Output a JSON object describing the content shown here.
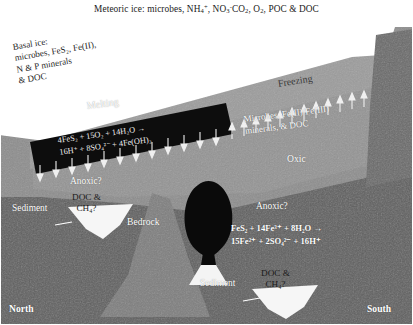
{
  "figure": {
    "title_caption": "Meteoric ice: microbes, NH4+, NO3-CO2, O2, POC & DOC",
    "caption_parts": {
      "lead": "Meteoric ice: microbes, NH",
      "nh4_sub": "4",
      "nh4_sup": "+",
      "mid": ", NO",
      "no3_sub": "3",
      "no3_sup": "-",
      "co2": "CO",
      "co2_sub": "2",
      "comma": ", O",
      "o2_sub": "2",
      "tail": ", POC & DOC"
    }
  },
  "labels": {
    "basal_ice": {
      "line1": "Basal ice:",
      "line2": "microbes, FeS₂, Fe(II),",
      "line3": "N & P minerals",
      "line4": "& DOC"
    },
    "melting": "Melting",
    "freezing": "Freezing",
    "oxic": "Oxic",
    "anoxic_left": "Anoxic?",
    "anoxic_right": "Anoxic?",
    "bedrock": "Bedrock",
    "sediment_left": "Sediment",
    "sediment_bottom": "Sediment",
    "north": "North",
    "south": "South",
    "right_solutes": {
      "line1": "Microbes, Fe(II)/Fe(III)",
      "line2": "minerals, & DOC"
    },
    "pocket_left": {
      "line1": "DOC &",
      "line2": "CH₄?"
    },
    "pocket_bottom": {
      "line1": "DOC &",
      "line2": "CH₄?"
    }
  },
  "equations": {
    "pyrite_oxidation": {
      "line1": "4FeS₂ + 15O₂ + 14H₂O →",
      "line2": "16H⁺ + 8SO₄²⁻ + 4Fe(OH)₃"
    },
    "ferric_pyrite_oxidation": {
      "line1": "FeS₂ + 14Fe³⁺ + 8H₂O →",
      "line2": "15Fe²⁺ + 2SO₄²⁻ + 16H⁺"
    }
  },
  "colors": {
    "background": "#ffffff",
    "meteoric_ice": "#ffffff",
    "basal_ice_black": "#0d0d0d",
    "ice_grey": "#9c9c9c",
    "upper_rock": "#8d8d8d",
    "lower_rock": "#5f5f5f",
    "bedrock_peak": "#7e7e7e",
    "plume_black": "#0a0a0a",
    "pocket_white": "#f6f6f6",
    "cliff_right": "#6a6a6a",
    "label_white": "#ffffff",
    "label_dark": "#1b1b1b",
    "border": "#4a4a4a"
  },
  "arrows": {
    "melting_direction": "down",
    "melting_count": 12,
    "freezing_direction": "up",
    "freezing_count": 16
  }
}
